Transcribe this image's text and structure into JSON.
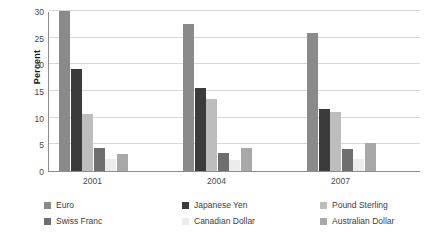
{
  "chart_data": {
    "type": "bar",
    "title": "",
    "subtitle": "",
    "xlabel": "",
    "ylabel": "Percent",
    "categories": [
      "2001",
      "2004",
      "2007"
    ],
    "ylim": [
      0,
      30
    ],
    "yticks": [
      0,
      5,
      10,
      15,
      20,
      25,
      30
    ],
    "ytick_labels": [
      "0",
      "5",
      "10",
      "15",
      "20",
      "25",
      "30"
    ],
    "grid": true,
    "grid_axis": "y",
    "legend_position": "bottom",
    "legend_columns": 3,
    "legend_rows": 2,
    "series": [
      {
        "name": "Euro",
        "color": "#8a8a8a",
        "values": [
          30.0,
          27.5,
          25.8
        ]
      },
      {
        "name": "Japanese Yen",
        "color": "#3b3b3b",
        "values": [
          19.2,
          15.5,
          11.7
        ]
      },
      {
        "name": "Pound Sterling",
        "color": "#bdbdbd",
        "values": [
          10.6,
          13.5,
          11.0
        ]
      },
      {
        "name": "Swiss Franc",
        "color": "#6e6e6e",
        "values": [
          4.3,
          3.4,
          4.2
        ]
      },
      {
        "name": "Canadian Dollar",
        "color": "#ececec",
        "values": [
          2.2,
          2.1,
          2.2
        ]
      },
      {
        "name": "Australian Dollar",
        "color": "#a8a8a8",
        "values": [
          3.2,
          4.3,
          5.3
        ]
      }
    ]
  },
  "axis": {
    "y_title": "Percent"
  },
  "colors": {
    "background": "#ffffff",
    "gridline": "#d8d8d8",
    "axis_line": "#8c8c8c",
    "tick_text": "#4a4a4a",
    "legend_text": "#3d3d3d"
  }
}
